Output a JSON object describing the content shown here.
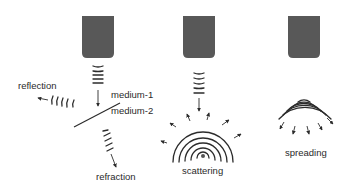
{
  "diagram": {
    "title": "",
    "colors": {
      "transducer": "#585858",
      "ink": "#2b2b2b",
      "background": "#ffffff"
    },
    "panels": [
      {
        "id": "reflection-refraction",
        "labels": {
          "reflection": "reflection",
          "medium_1": "medium-1",
          "medium_2": "medium-2",
          "refraction": "refraction"
        }
      },
      {
        "id": "scattering",
        "labels": {
          "caption": "scattering"
        }
      },
      {
        "id": "spreading",
        "labels": {
          "caption": "spreading"
        }
      }
    ]
  }
}
